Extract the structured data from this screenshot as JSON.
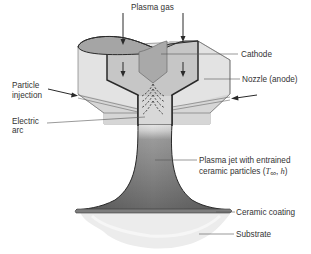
{
  "diagram": {
    "type": "schematic",
    "labels": {
      "plasma_gas": "Plasma gas",
      "cathode": "Cathode",
      "nozzle": "Nozzle (anode)",
      "particle_injection_line1": "Particle",
      "particle_injection_line2": "injection",
      "electric_arc_line1": "Electric",
      "electric_arc_line2": "arc",
      "plasma_jet_line1": "Plasma jet with entrained",
      "plasma_jet_line2_prefix": "ceramic particles (",
      "plasma_jet_T": "T",
      "plasma_jet_T_sub": "∞",
      "plasma_jet_sep": ", ",
      "plasma_jet_h": "h",
      "plasma_jet_close": ")",
      "ceramic_coating": "Ceramic coating",
      "substrate": "Substrate"
    },
    "colors": {
      "nozzle_fill": "#e3e3e3",
      "inner_chamber": "#c6c6c6",
      "cathode_fill": "#a9a9a9",
      "top_ellipse": "#a5a5a5",
      "jet_dark": "#6e6e6e",
      "jet_light": "#b4b4b4",
      "coating": "#7d7d7d",
      "substrate": "#ececec",
      "outline": "#2a2a2a"
    }
  }
}
